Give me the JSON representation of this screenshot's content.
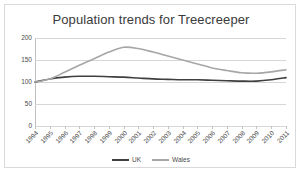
{
  "chart_data": {
    "type": "line",
    "title": "Population trends for Treecreeper",
    "xlabel": "",
    "ylabel": "",
    "ylim": [
      0,
      200
    ],
    "yticks": [
      0,
      50,
      100,
      150,
      200
    ],
    "grid": true,
    "legend_position": "bottom-center",
    "categories": [
      "1994",
      "1995",
      "1996",
      "1997",
      "1998",
      "1999",
      "2000",
      "2001",
      "2002",
      "2003",
      "2004",
      "2005",
      "2006",
      "2007",
      "2008",
      "2009",
      "2010",
      "2011"
    ],
    "series": [
      {
        "name": "UK",
        "color": "#3f3f3f",
        "values": [
          100,
          107,
          111,
          113,
          113,
          112,
          111,
          109,
          107,
          106,
          105,
          105,
          104,
          103,
          102,
          102,
          105,
          110
        ]
      },
      {
        "name": "Wales",
        "color": "#a6a6a6",
        "values": [
          100,
          107,
          122,
          138,
          153,
          168,
          179,
          176,
          168,
          159,
          150,
          141,
          132,
          126,
          121,
          120,
          123,
          128
        ]
      }
    ]
  },
  "legend": {
    "items": [
      {
        "label": "UK",
        "color": "#3f3f3f"
      },
      {
        "label": "Wales",
        "color": "#a6a6a6"
      }
    ]
  },
  "colors": {
    "frame_border": "#d9d9d9",
    "gridline": "#d6d6d6",
    "axis": "#bfbfbf",
    "text": "#4a4a4a",
    "title_text": "#3a3a3a",
    "background": "#ffffff"
  }
}
